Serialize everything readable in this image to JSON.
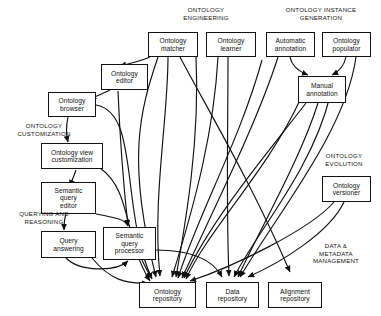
{
  "diagram": {
    "background_color": "#ffffff",
    "line_color": "#111111",
    "box_border_color": "#111111",
    "nodes": [
      {
        "id": "ontology-matcher",
        "label": "Ontology\nmatcher"
      },
      {
        "id": "ontology-learner",
        "label": "Ontology\nlearner"
      },
      {
        "id": "automatic-annotation",
        "label": "Automatic\nannotation"
      },
      {
        "id": "ontology-populator",
        "label": "Ontology\npopulator"
      },
      {
        "id": "manual-annotation",
        "label": "Manual\nannotation"
      },
      {
        "id": "ontology-editor",
        "label": "Ontology\neditor"
      },
      {
        "id": "ontology-browser",
        "label": "Ontology\nbrowser"
      },
      {
        "id": "ontology-view-customization",
        "label": "Ontology view\ncustomization"
      },
      {
        "id": "semantic-query-editor",
        "label": "Semantic\nquery\neditor"
      },
      {
        "id": "query-answering",
        "label": "Query\nanswering"
      },
      {
        "id": "semantic-query-processor",
        "label": "Semantic\nquery\nprocessor"
      },
      {
        "id": "ontology-versioner",
        "label": "Ontology\nversioner"
      },
      {
        "id": "ontology-repository",
        "label": "Ontology\nrepository"
      },
      {
        "id": "data-repository",
        "label": "Data\nrepository"
      },
      {
        "id": "alignment-repository",
        "label": "Alignment\nrepository"
      }
    ],
    "group_labels": [
      {
        "id": "ontology-engineering",
        "label": "ONTOLOGY\nENGINEERING"
      },
      {
        "id": "ontology-instance-generation",
        "label": "ONTOLOGY INSTANCE\nGENERATION"
      },
      {
        "id": "ontology-customization",
        "label": "ONTOLOGY\nCUSTOMIZATION"
      },
      {
        "id": "querying-and-reasoning",
        "label": "QUERYING AND\nREASONING"
      },
      {
        "id": "ontology-evolution",
        "label": "ONTOLOGY\nEVOLUTION"
      },
      {
        "id": "data-metadata-management",
        "label": "DATA &\nMETADATA\nMANAGEMENT"
      }
    ]
  }
}
